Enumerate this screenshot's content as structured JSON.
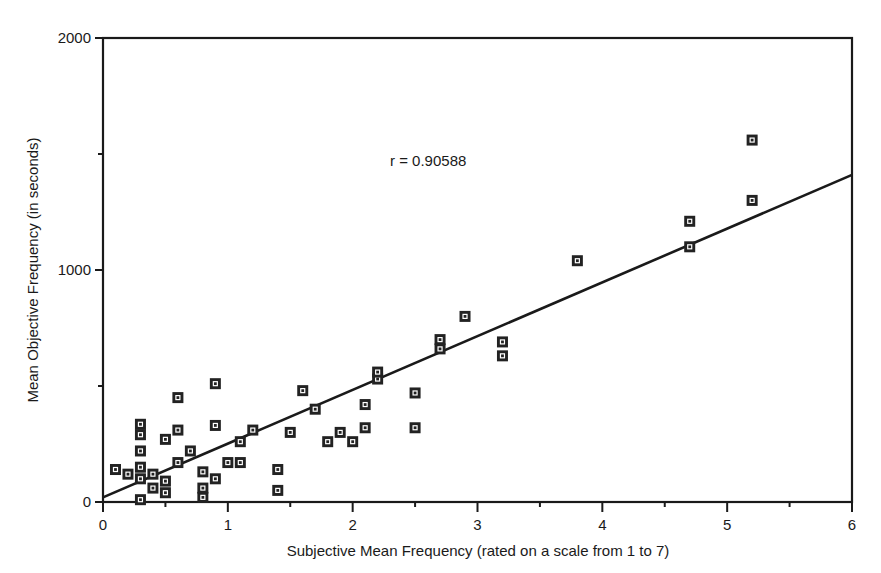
{
  "chart_data": {
    "type": "scatter",
    "title": "",
    "xlabel": "Subjective Mean Frequency (rated on a scale from 1 to 7)",
    "ylabel": "Mean Objective Frequency (in seconds)",
    "xlim": [
      0,
      6
    ],
    "ylim": [
      0,
      2000
    ],
    "x_ticks": [
      "0",
      "1",
      "2",
      "3",
      "4",
      "5",
      "6"
    ],
    "y_ticks": [
      "0",
      "1000",
      "2000"
    ],
    "grid": false,
    "legend": null,
    "annotation": "r = 0.90588",
    "regression_line": {
      "x": [
        0,
        6
      ],
      "y": [
        20,
        1410
      ]
    },
    "marker": "square",
    "series": [
      {
        "name": "items",
        "points": [
          [
            0.1,
            140
          ],
          [
            0.2,
            120
          ],
          [
            0.3,
            10
          ],
          [
            0.3,
            100
          ],
          [
            0.3,
            150
          ],
          [
            0.3,
            220
          ],
          [
            0.3,
            290
          ],
          [
            0.3,
            335
          ],
          [
            0.4,
            60
          ],
          [
            0.4,
            120
          ],
          [
            0.5,
            40
          ],
          [
            0.5,
            90
          ],
          [
            0.5,
            270
          ],
          [
            0.6,
            170
          ],
          [
            0.6,
            310
          ],
          [
            0.6,
            450
          ],
          [
            0.7,
            220
          ],
          [
            0.8,
            20
          ],
          [
            0.8,
            60
          ],
          [
            0.8,
            130
          ],
          [
            0.9,
            100
          ],
          [
            0.9,
            330
          ],
          [
            0.9,
            510
          ],
          [
            1.0,
            170
          ],
          [
            1.1,
            170
          ],
          [
            1.1,
            260
          ],
          [
            1.2,
            310
          ],
          [
            1.4,
            50
          ],
          [
            1.4,
            140
          ],
          [
            1.5,
            300
          ],
          [
            1.6,
            480
          ],
          [
            1.7,
            400
          ],
          [
            1.8,
            260
          ],
          [
            1.9,
            300
          ],
          [
            2.0,
            260
          ],
          [
            2.1,
            320
          ],
          [
            2.1,
            420
          ],
          [
            2.2,
            530
          ],
          [
            2.2,
            560
          ],
          [
            2.5,
            320
          ],
          [
            2.5,
            470
          ],
          [
            2.7,
            660
          ],
          [
            2.7,
            700
          ],
          [
            2.9,
            800
          ],
          [
            3.2,
            630
          ],
          [
            3.2,
            690
          ],
          [
            3.8,
            1040
          ],
          [
            4.7,
            1100
          ],
          [
            4.7,
            1210
          ],
          [
            5.2,
            1300
          ],
          [
            5.2,
            1560
          ]
        ]
      }
    ]
  }
}
